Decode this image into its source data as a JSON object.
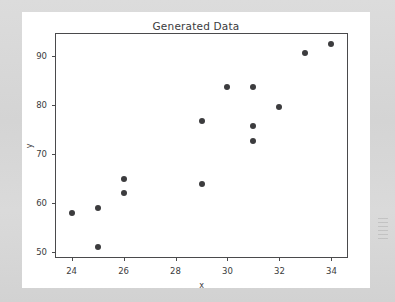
{
  "figure": {
    "title": "Generated Data",
    "background_color": "#ffffff",
    "outer_background_color": "#d8d8d8",
    "axes_edge_color": "#4a4a4c"
  },
  "chart_data": {
    "type": "scatter",
    "title": "Generated Data",
    "xlabel": "x",
    "ylabel": "y",
    "xlim": [
      23.4,
      34.6
    ],
    "ylim": [
      49.0,
      94.5
    ],
    "grid": false,
    "legend": null,
    "marker_color": "#3c3c3e",
    "marker_size": 6,
    "xticks": [
      24,
      26,
      28,
      30,
      32,
      34
    ],
    "xtick_labels": [
      "24",
      "26",
      "28",
      "30",
      "32",
      "34"
    ],
    "yticks": [
      50,
      60,
      70,
      80,
      90
    ],
    "ytick_labels": [
      "50",
      "60",
      "70",
      "80",
      "90"
    ],
    "points": [
      {
        "x": 24,
        "y": 58.0
      },
      {
        "x": 25,
        "y": 59.0
      },
      {
        "x": 25,
        "y": 51.0
      },
      {
        "x": 26,
        "y": 65.0
      },
      {
        "x": 26,
        "y": 62.0
      },
      {
        "x": 29,
        "y": 76.8
      },
      {
        "x": 29,
        "y": 63.8
      },
      {
        "x": 30,
        "y": 83.7
      },
      {
        "x": 31,
        "y": 83.7
      },
      {
        "x": 31,
        "y": 75.8
      },
      {
        "x": 31,
        "y": 72.7
      },
      {
        "x": 32,
        "y": 79.7
      },
      {
        "x": 33,
        "y": 90.6
      },
      {
        "x": 34,
        "y": 92.4
      }
    ]
  }
}
